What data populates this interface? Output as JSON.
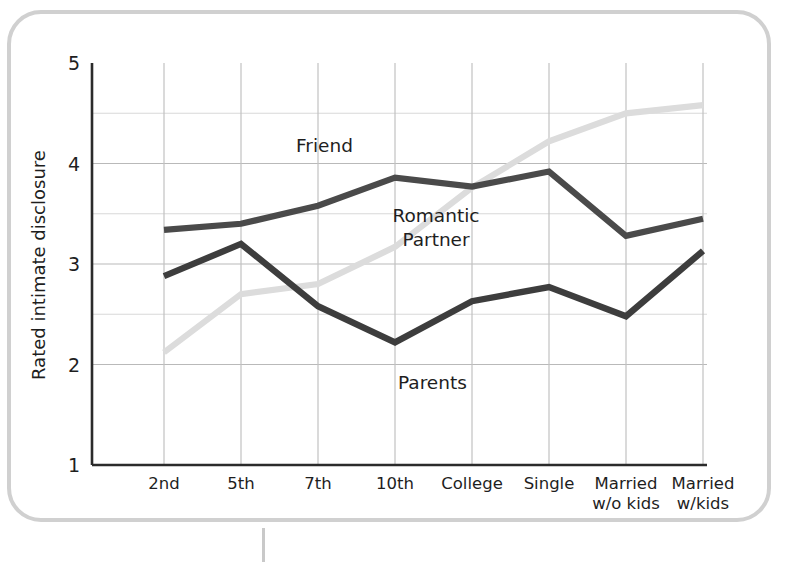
{
  "figure": {
    "frame_color": "#d0d0d0",
    "background": "#ffffff"
  },
  "chart_data": {
    "type": "line",
    "title": "",
    "xlabel": "",
    "ylabel": "Rated intimate disclosure",
    "categories": [
      "2nd",
      "5th",
      "7th",
      "10th",
      "College",
      "Single",
      "Married w/o kids",
      "Married w/kids"
    ],
    "category_lines": [
      [
        "2nd"
      ],
      [
        "5th"
      ],
      [
        "7th"
      ],
      [
        "10th"
      ],
      [
        "College"
      ],
      [
        "Single"
      ],
      [
        "Married",
        "w/o kids"
      ],
      [
        "Married",
        "w/kids"
      ]
    ],
    "ylim": [
      1,
      5
    ],
    "yticks": [
      1,
      2,
      3,
      4,
      5
    ],
    "ytick_labels": [
      "1",
      "2",
      "3",
      "4",
      "5"
    ],
    "y_minor_gridlines": [
      2.5,
      3.5,
      4.5
    ],
    "grid": true,
    "legend_position": "inline-annotations",
    "series": [
      {
        "name": "Friend",
        "color": "#4a4a4a",
        "values": [
          3.34,
          3.4,
          3.58,
          3.86,
          3.77,
          3.92,
          3.28,
          3.45
        ]
      },
      {
        "name": "Parents",
        "color": "#3d3d3d",
        "values": [
          2.88,
          3.2,
          2.58,
          2.22,
          2.63,
          2.77,
          2.48,
          3.13
        ]
      },
      {
        "name": "Romantic Partner",
        "color": "#dcdcdc",
        "values": [
          2.12,
          2.7,
          2.8,
          3.17,
          3.76,
          4.22,
          4.5,
          4.58
        ]
      }
    ],
    "annotations": [
      {
        "name": "friend-label",
        "text": "Friend",
        "lines": [
          "Friend"
        ],
        "x": 296,
        "y": 152
      },
      {
        "name": "romantic-partner-label",
        "text": "Romantic Partner",
        "lines": [
          "Romantic",
          "Partner"
        ],
        "x": 436,
        "y": 222
      },
      {
        "name": "parents-label",
        "text": "Parents",
        "lines": [
          "Parents"
        ],
        "x": 398,
        "y": 389
      }
    ]
  }
}
